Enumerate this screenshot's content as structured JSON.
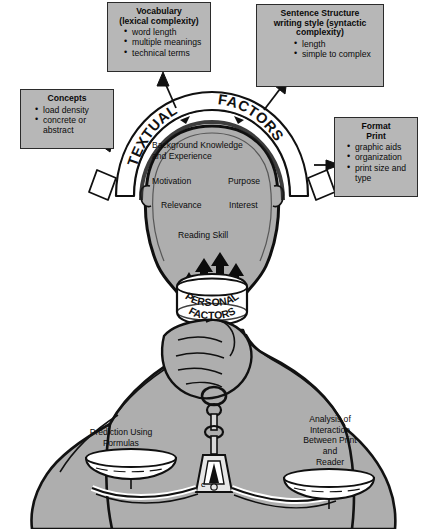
{
  "diagram": {
    "colors": {
      "skin_fill": "#aeaeae",
      "box_fill": "#b7b7b7",
      "outline": "#1a1a1a",
      "paper": "#ffffff",
      "arrow": "#111111"
    },
    "arc_label": {
      "word1": "TEXTUAL",
      "word2": "FACTORS"
    },
    "collar_label": {
      "word1": "PERSONAL",
      "word2": "FACTORS"
    },
    "boxes": [
      {
        "name": "vocabulary",
        "title_lines": [
          "Vocabulary",
          "(lexical complexity)"
        ],
        "items": [
          "word length",
          "multiple meanings",
          "technical terms"
        ]
      },
      {
        "name": "sentence-structure",
        "title_lines": [
          "Sentence Structure",
          "writing style (syntactic",
          "complexity)"
        ],
        "items": [
          "length",
          "simple to complex"
        ]
      },
      {
        "name": "concepts",
        "title_lines": [
          "Concepts"
        ],
        "items": [
          "load density",
          "concrete or abstract"
        ]
      },
      {
        "name": "format-print",
        "title_lines": [
          "Format",
          "Print"
        ],
        "items": [
          "graphic aids",
          "organization",
          "print size and type"
        ]
      }
    ],
    "head_labels": [
      "Background Knowledge",
      "and Experience",
      "Motivation",
      "Purpose",
      "Relevance",
      "Interest",
      "Reading Skill"
    ],
    "scale": {
      "left_pan_label": "Prediction Using Formulas",
      "left_pan_lines": [
        "Prediction Using",
        "Formulas"
      ],
      "right_pan_label": "Analysis of Interaction Between Print and Reader",
      "right_pan_lines": [
        "Analysis of",
        "Interaction",
        "Between Print",
        "and",
        "Reader"
      ],
      "fulcrum_mark": "C"
    },
    "arrows": {
      "count_neck": 4,
      "direction_neck": "up",
      "callout_targets": [
        "vocabulary",
        "sentence-structure",
        "concepts",
        "format-print"
      ]
    }
  }
}
